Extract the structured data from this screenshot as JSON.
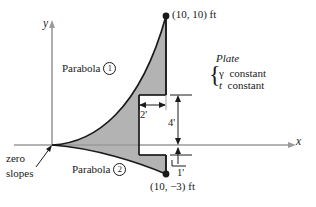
{
  "figure": {
    "axes": {
      "x_label": "x",
      "y_label": "y"
    },
    "fill_color": "#b3b3b3",
    "line_color": "#1a1a1a",
    "axis_color": "#8c8c8c",
    "points": [
      {
        "name": "top-vertex",
        "label": "(10, 10) ft"
      },
      {
        "name": "bottom-vertex",
        "label": "(10, −3) ft"
      }
    ],
    "curves": [
      {
        "name": "parabola-1",
        "label": "Parabola",
        "number": "1"
      },
      {
        "name": "parabola-2",
        "label": "Parabola",
        "number": "2"
      }
    ],
    "annotations": {
      "zero_slopes_line1": "zero",
      "zero_slopes_line2": "slopes",
      "plate_title": "Plate",
      "plate_prop_1_symbol": "γ",
      "plate_prop_1_text": "constant",
      "plate_prop_2_symbol": "t",
      "plate_prop_2_text": "constant",
      "brace_glyph": "{"
    },
    "dimensions": [
      {
        "name": "width-2ft",
        "label": "2'"
      },
      {
        "name": "height-4ft",
        "label": "4'"
      },
      {
        "name": "height-1ft",
        "label": "1'"
      }
    ],
    "caption": ""
  }
}
